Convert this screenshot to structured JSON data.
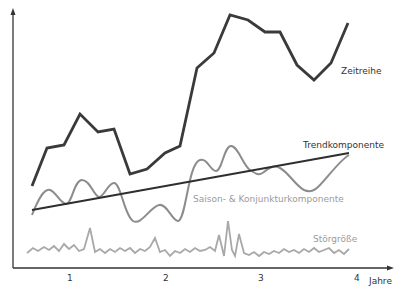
{
  "chart_data": {
    "type": "line",
    "title": "",
    "xlabel": "Jahre",
    "ylabel": "",
    "x_ticks": [
      "1",
      "2",
      "3",
      "4"
    ],
    "grid": false,
    "legend": "inline labels",
    "colors": {
      "zeitreihe": "#3a3a3a",
      "trend": "#2e2e2e",
      "saison": "#8c8c8c",
      "stoer": "#a8a8a8",
      "axis": "#333333"
    },
    "series": [
      {
        "name": "Zeitreihe",
        "points": [
          [
            32,
            186
          ],
          [
            47,
            148
          ],
          [
            64,
            145
          ],
          [
            80,
            114
          ],
          [
            98,
            132
          ],
          [
            114,
            129
          ],
          [
            130,
            174
          ],
          [
            147,
            169
          ],
          [
            165,
            153
          ],
          [
            180,
            146
          ],
          [
            197,
            68
          ],
          [
            214,
            53
          ],
          [
            230,
            15
          ],
          [
            248,
            20
          ],
          [
            265,
            32
          ],
          [
            280,
            32
          ],
          [
            297,
            65
          ],
          [
            314,
            80
          ],
          [
            331,
            63
          ],
          [
            348,
            23
          ]
        ]
      },
      {
        "name": "Trendkomponente",
        "points": [
          [
            32,
            210
          ],
          [
            349,
            153
          ]
        ]
      },
      {
        "name": "Saison- & Konjunkturkomponente",
        "path": "M32,215 C38,200 44,188 50,190 C56,192 60,203 66,204 C72,204 74,180 82,180 C90,180 94,196 99,197 C104,197 108,183 114,183 C121,183 124,215 133,221 C141,226 150,207 159,205 C167,203 172,221 178,221 C186,221 188,163 200,160 C208,158 210,171 216,171 C222,171 224,146 231,146 C238,146 243,165 250,170 C256,174 259,176 264,172 C270,167 274,165 280,168 C288,172 296,186 304,190 C311,193 315,190 320,185 C328,177 340,160 349,155"
      },
      {
        "name": "Störgröße",
        "points": [
          [
            27,
            253
          ],
          [
            33,
            248
          ],
          [
            38,
            251
          ],
          [
            44,
            247
          ],
          [
            49,
            250
          ],
          [
            54,
            246
          ],
          [
            59,
            251
          ],
          [
            64,
            244
          ],
          [
            69,
            249
          ],
          [
            74,
            245
          ],
          [
            79,
            251
          ],
          [
            84,
            249
          ],
          [
            90,
            228
          ],
          [
            95,
            252
          ],
          [
            100,
            249
          ],
          [
            105,
            253
          ],
          [
            110,
            249
          ],
          [
            115,
            252
          ],
          [
            120,
            248
          ],
          [
            125,
            251
          ],
          [
            130,
            248
          ],
          [
            135,
            253
          ],
          [
            140,
            249
          ],
          [
            145,
            251
          ],
          [
            150,
            247
          ],
          [
            155,
            238
          ],
          [
            160,
            252
          ],
          [
            165,
            250
          ],
          [
            170,
            256
          ],
          [
            175,
            251
          ],
          [
            180,
            253
          ],
          [
            185,
            249
          ],
          [
            190,
            252
          ],
          [
            195,
            248
          ],
          [
            200,
            251
          ],
          [
            205,
            250
          ],
          [
            210,
            247
          ],
          [
            215,
            251
          ],
          [
            219,
            235
          ],
          [
            224,
            256
          ],
          [
            228,
            221
          ],
          [
            232,
            250
          ],
          [
            235,
            256
          ],
          [
            239,
            234
          ],
          [
            244,
            253
          ],
          [
            249,
            255
          ],
          [
            254,
            252
          ],
          [
            259,
            256
          ],
          [
            264,
            252
          ],
          [
            269,
            254
          ],
          [
            274,
            251
          ],
          [
            279,
            253
          ],
          [
            284,
            249
          ],
          [
            289,
            252
          ],
          [
            294,
            250
          ],
          [
            299,
            253
          ],
          [
            304,
            249
          ],
          [
            309,
            252
          ],
          [
            314,
            248
          ],
          [
            319,
            252
          ],
          [
            324,
            250
          ],
          [
            329,
            248
          ],
          [
            334,
            253
          ],
          [
            339,
            250
          ],
          [
            344,
            254
          ],
          [
            349,
            249
          ]
        ]
      }
    ],
    "labels": {
      "zeitreihe": "Zeitreihe",
      "trend": "Trendkomponente",
      "saison": "Saison- & Konjunkturkomponente",
      "stoer": "Störgröße"
    }
  }
}
